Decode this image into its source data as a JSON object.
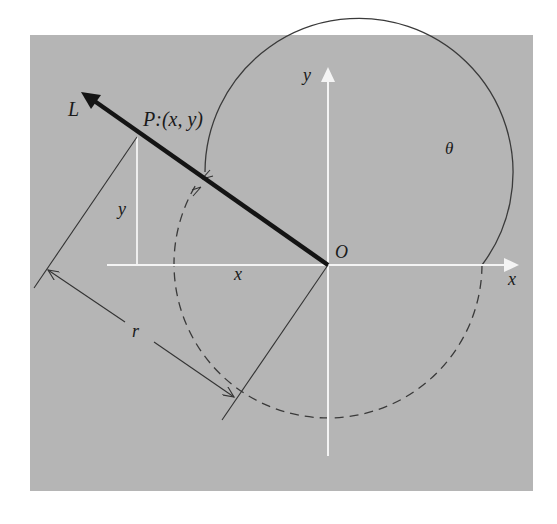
{
  "diagram": {
    "type": "unit-circle-rotation",
    "colors": {
      "background": "#ffffff",
      "panel": "#b5b5b5",
      "axes": "#f4f4f4",
      "line_L": "#141414",
      "circle": "#3a3a3a",
      "dimension": "#333333"
    },
    "labels": {
      "line_L": "L",
      "point_P": "P:(x, y)",
      "y_axis": "y",
      "x_axis": "x",
      "origin": "O",
      "angle": "θ",
      "y_segment": "y",
      "x_segment": "x",
      "radius": "r"
    },
    "geometry": {
      "origin": [
        328,
        265
      ],
      "circle_radius": 154,
      "point_P": [
        137,
        137
      ]
    }
  }
}
